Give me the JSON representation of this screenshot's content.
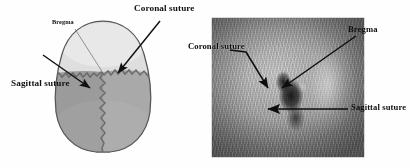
{
  "figure": {
    "background_color": "#fefefe",
    "width": 412,
    "height": 168,
    "panels": [
      {
        "id": "left",
        "type": "diagram",
        "description": "Superior view schematic drawing of a skull showing frontal bone, parietal bones, coronal suture and sagittal suture"
      },
      {
        "id": "right",
        "type": "photograph",
        "description": "Grayscale photograph of a surgically exposed rodent skull with retracted scalp showing bregma and sutures"
      }
    ]
  },
  "diagram": {
    "labels": {
      "bregma": "Bregma",
      "coronal_suture": "Coronal suture",
      "sagittal_suture": "Sagittal suture"
    },
    "colors": {
      "frontal_bone": "#dedede",
      "parietal_left": "#9a9a9a",
      "parietal_right": "#a8a8a8",
      "outline": "#5d5d5d",
      "suture": "#6b6b6b",
      "arrow": "#111111"
    },
    "regions": [
      {
        "name": "frontal-bone",
        "shade": "light"
      },
      {
        "name": "parietal-bone-left",
        "shade": "dark"
      },
      {
        "name": "parietal-bone-right",
        "shade": "mid"
      }
    ]
  },
  "photo": {
    "labels": {
      "bregma": "Bregma",
      "coronal_suture": "Coronal suture",
      "sagittal_suture": "Sagittal suture"
    },
    "colors": {
      "arrow": "#0d0d0d",
      "field_light": "#c9c9c9",
      "field_dark": "#6e6e6e"
    }
  }
}
